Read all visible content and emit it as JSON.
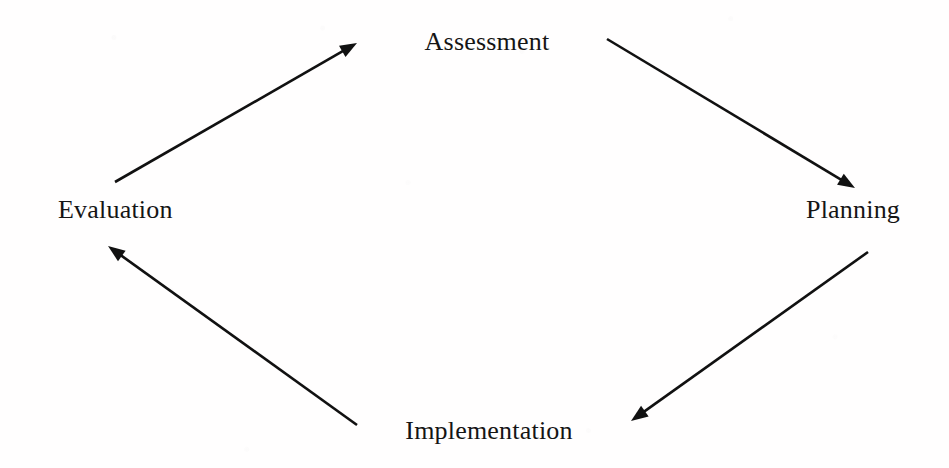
{
  "diagram": {
    "type": "cycle-flow",
    "title": "",
    "background_color": "#ffffff",
    "text_color": "#151515",
    "stroke_color": "#111111",
    "nodes": [
      {
        "id": "assessment",
        "label": "Assessment",
        "position": "top",
        "x": 487,
        "y": 42
      },
      {
        "id": "planning",
        "label": "Planning",
        "position": "right",
        "x": 866,
        "y": 210
      },
      {
        "id": "implementation",
        "label": "Implementation",
        "position": "bottom",
        "x": 489,
        "y": 431
      },
      {
        "id": "evaluation",
        "label": "Evaluation",
        "position": "left",
        "x": 118,
        "y": 210
      }
    ],
    "edges": [
      {
        "id": "assessment-to-planning",
        "from": "assessment",
        "to": "planning",
        "direction": "down-right",
        "x1": 607,
        "y1": 39,
        "x2": 855,
        "y2": 188
      },
      {
        "id": "planning-to-implementation",
        "from": "planning",
        "to": "implementation",
        "direction": "down-left",
        "x1": 868,
        "y1": 252,
        "x2": 631,
        "y2": 421
      },
      {
        "id": "implementation-to-evaluation",
        "from": "implementation",
        "to": "evaluation",
        "direction": "up-left",
        "x1": 357,
        "y1": 425,
        "x2": 108,
        "y2": 246
      },
      {
        "id": "evaluation-to-assessment",
        "from": "evaluation",
        "to": "assessment",
        "direction": "up-right",
        "x1": 115,
        "y1": 182,
        "x2": 357,
        "y2": 43
      }
    ],
    "stroke_width": 2.6,
    "arrowhead_length": 17,
    "arrowhead_width": 13
  }
}
